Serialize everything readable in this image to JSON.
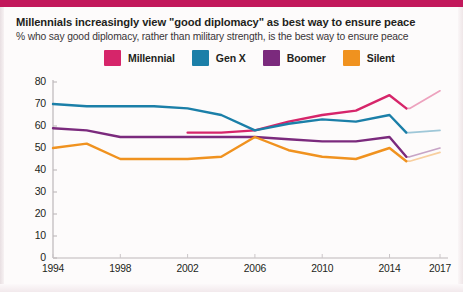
{
  "header": {
    "title": "Millennials increasingly view \"good diplomacy\" as best way to ensure peace",
    "subtitle": "% who say good diplomacy, rather than military strength, is the best way to ensure peace"
  },
  "legend": {
    "position": "top",
    "items": [
      {
        "label": "Millennial",
        "color": "#d6256a"
      },
      {
        "label": "Gen X",
        "color": "#1b7fa8"
      },
      {
        "label": "Boomer",
        "color": "#7b2a7d"
      },
      {
        "label": "Silent",
        "color": "#f0921f"
      }
    ]
  },
  "axes": {
    "y_ticks": [
      "0",
      "10",
      "20",
      "30",
      "40",
      "50",
      "60",
      "70",
      "80"
    ],
    "x_ticks": [
      "1994",
      "1998",
      "2002",
      "2006",
      "2010",
      "2014",
      "2017"
    ]
  },
  "chart_data": {
    "type": "line",
    "title": "Millennials increasingly view \"good diplomacy\" as best way to ensure peace",
    "subtitle": "% who say good diplomacy, rather than military strength, is the best way to ensure peace",
    "xlabel": "",
    "ylabel": "",
    "xlim": [
      1994,
      2017
    ],
    "ylim": [
      0,
      80
    ],
    "ytick_step": 10,
    "grid": false,
    "legend_position": "top",
    "series": [
      {
        "name": "Millennial",
        "color": "#d6256a",
        "x": [
          2002,
          2004,
          2006,
          2008,
          2010,
          2012,
          2014,
          2015,
          2015.2,
          2017
        ],
        "values": [
          57,
          57,
          58,
          62,
          65,
          67,
          74,
          68,
          68,
          76
        ],
        "style": "solid",
        "break_after_x": 2015,
        "trailing_style": "faded"
      },
      {
        "name": "Gen X",
        "color": "#1b7fa8",
        "x": [
          1994,
          1996,
          1998,
          2000,
          2002,
          2004,
          2006,
          2008,
          2010,
          2012,
          2014,
          2015,
          2015.2,
          2017
        ],
        "values": [
          70,
          69,
          69,
          69,
          68,
          65,
          58,
          61,
          63,
          62,
          65,
          57,
          57,
          58
        ],
        "style": "solid",
        "break_after_x": 2015,
        "trailing_style": "faded"
      },
      {
        "name": "Boomer",
        "color": "#7b2a7d",
        "x": [
          1994,
          1996,
          1998,
          2000,
          2002,
          2004,
          2006,
          2008,
          2010,
          2012,
          2014,
          2015,
          2015.2,
          2017
        ],
        "values": [
          59,
          58,
          55,
          55,
          55,
          55,
          55,
          54,
          53,
          53,
          55,
          46,
          46,
          50
        ],
        "style": "solid",
        "break_after_x": 2015,
        "trailing_style": "faded"
      },
      {
        "name": "Silent",
        "color": "#f0921f",
        "x": [
          1994,
          1996,
          1998,
          2000,
          2002,
          2004,
          2006,
          2008,
          2010,
          2012,
          2014,
          2015,
          2015.2,
          2017
        ],
        "values": [
          50,
          52,
          45,
          45,
          45,
          46,
          55,
          49,
          46,
          45,
          50,
          44,
          44,
          48
        ],
        "style": "solid",
        "break_after_x": 2015,
        "trailing_style": "faded"
      }
    ]
  }
}
